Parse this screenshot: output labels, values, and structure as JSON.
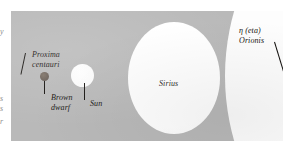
{
  "figure": {
    "kind": "relative-stellar-size-diagram",
    "panel_color": "#b9b9b9",
    "star_color": "#fdfdfd",
    "brown_dwarf_color": "#6b6058",
    "label_color": "#15120f"
  },
  "labels": {
    "proxima_centauri": "Proxima\ncentauri",
    "proxima_centauri_line1": "Proxima",
    "proxima_centauri_line2": "centauri",
    "brown_dwarf_line1": "Brown",
    "brown_dwarf_line2": "dwarf",
    "sun": "Sun",
    "sirius": "Sirius",
    "eta_orionis_line1": "η (eta)",
    "eta_orionis_line2": "Orionis",
    "eta_symbol": "η",
    "eta_paren": " (eta)"
  },
  "margin_fragments": {
    "top": "y",
    "mid": "s",
    "low": "s",
    "tail": "r"
  }
}
